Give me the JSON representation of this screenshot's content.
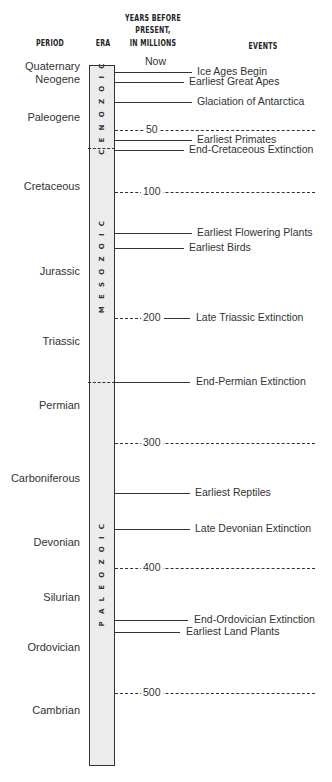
{
  "header": {
    "period": "PERIOD",
    "era": "ERA",
    "years_line1": "YEARS BEFORE",
    "years_line2": "PRESENT,",
    "years_line3": "IN MILLIONS",
    "events": "EVENTS"
  },
  "periods": [
    {
      "name": "Quaternary",
      "y": 66
    },
    {
      "name": "Neogene",
      "y": 79
    },
    {
      "name": "Paleogene",
      "y": 117
    },
    {
      "name": "Cretaceous",
      "y": 186
    },
    {
      "name": "Jurassic",
      "y": 271
    },
    {
      "name": "Triassic",
      "y": 341
    },
    {
      "name": "Permian",
      "y": 405
    },
    {
      "name": "Carboniferous",
      "y": 478
    },
    {
      "name": "Devonian",
      "y": 542
    },
    {
      "name": "Silurian",
      "y": 597
    },
    {
      "name": "Ordovician",
      "y": 647
    },
    {
      "name": "Cambrian",
      "y": 710
    }
  ],
  "eras": [
    {
      "name": "CENOZOIC",
      "top": 0,
      "height": 83
    },
    {
      "name": "MESOZOIC",
      "top": 83,
      "height": 234
    },
    {
      "name": "PALEOZOIC",
      "top": 317,
      "height": 382
    }
  ],
  "era_separators": [
    148,
    382
  ],
  "ticks": [
    {
      "label": "Now",
      "y": 67
    },
    {
      "label": "50",
      "y": 130
    },
    {
      "label": "100",
      "y": 192
    },
    {
      "label": "200",
      "y": 318
    },
    {
      "label": "300",
      "y": 443
    },
    {
      "label": "400",
      "y": 568
    },
    {
      "label": "500",
      "y": 693
    }
  ],
  "events": [
    {
      "label": "Ice Ages Begin",
      "y": 72,
      "line_end": 192,
      "text_x": 197
    },
    {
      "label": "Earliest Great Apes",
      "y": 82,
      "line_end": 184,
      "text_x": 189
    },
    {
      "label": "Glaciation of Antarctica",
      "y": 102,
      "line_end": 192,
      "text_x": 197
    },
    {
      "label": "Earliest Primates",
      "y": 140,
      "line_end": 192,
      "text_x": 197
    },
    {
      "label": "End-Cretaceous Extinction",
      "y": 150,
      "line_end": 184,
      "text_x": 189
    },
    {
      "label": "Earliest Flowering Plants",
      "y": 233,
      "line_end": 192,
      "text_x": 197
    },
    {
      "label": "Earliest Birds",
      "y": 248,
      "line_end": 184,
      "text_x": 189
    },
    {
      "label": "Late Triassic Extinction",
      "y": 318,
      "line_start": 164,
      "line_end": 190,
      "text_x": 196
    },
    {
      "label": "End-Permian Extinction",
      "y": 382,
      "line_end": 190,
      "text_x": 196
    },
    {
      "label": "Earliest Reptiles",
      "y": 493,
      "line_end": 190,
      "text_x": 195
    },
    {
      "label": "Late Devonian Extinction",
      "y": 529,
      "line_end": 190,
      "text_x": 195
    },
    {
      "label": "End-Ordovician Extinction",
      "y": 620,
      "line_end": 188,
      "text_x": 194
    },
    {
      "label": "Earliest Land Plants",
      "y": 632,
      "line_end": 180,
      "text_x": 186
    }
  ]
}
